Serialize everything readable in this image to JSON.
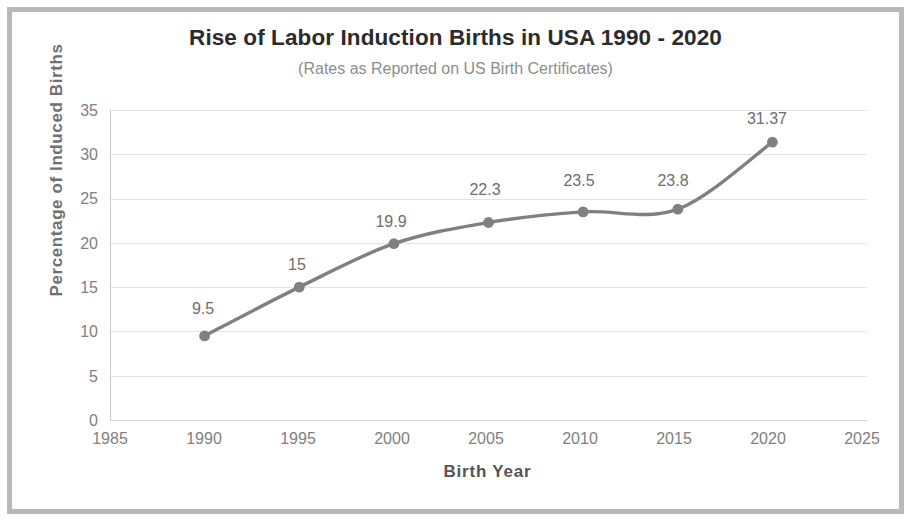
{
  "chart_data": {
    "type": "line",
    "title": "Rise of Labor Induction Births in USA  1990 - 2020",
    "subtitle": "(Rates as Reported on US Birth Certificates)",
    "xlabel": "Birth Year",
    "ylabel": "Percentage of  Induced  Births",
    "x": [
      1990,
      1995,
      2000,
      2005,
      2010,
      2015,
      2020
    ],
    "values": [
      9.5,
      15,
      19.9,
      22.3,
      23.5,
      23.8,
      31.37
    ],
    "point_labels": [
      "9.5",
      "15",
      "19.9",
      "22.3",
      "23.5",
      "23.8",
      "31.37"
    ],
    "xlim": [
      1985,
      2025
    ],
    "ylim": [
      0,
      35
    ],
    "xticks": [
      "1985",
      "1990",
      "1995",
      "2000",
      "2005",
      "2010",
      "2015",
      "2020",
      "2025"
    ],
    "yticks": [
      "0",
      "5",
      "10",
      "15",
      "20",
      "25",
      "30",
      "35"
    ],
    "grid": "horizontal",
    "legend": "none",
    "series_color": "#808080",
    "marker_color": "#808080",
    "grid_color": "#e2e2e2",
    "title_color": "#2b2b2b",
    "subtitle_color": "#8d8d8d",
    "axis_label_color": "#808080",
    "frame_color": "#b8b8b8"
  }
}
